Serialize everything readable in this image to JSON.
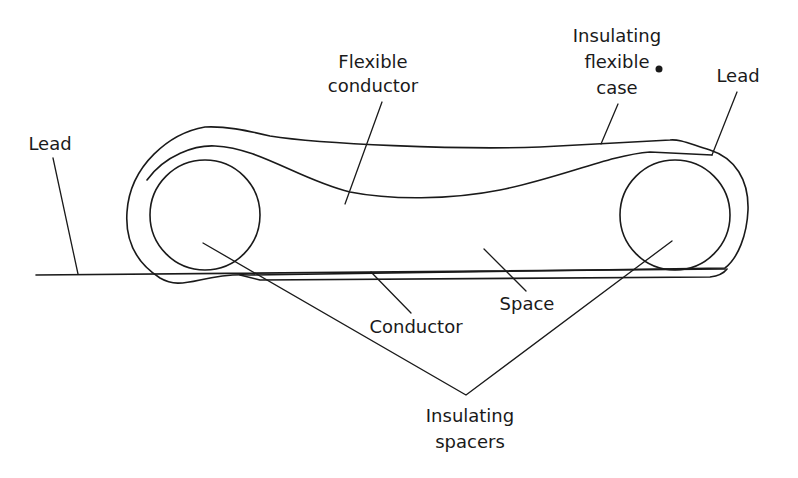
{
  "diagram": {
    "labels": {
      "flexible_conductor": [
        "Flexible",
        "conductor"
      ],
      "insulating_flexible_case": [
        "Insulating",
        "flexible",
        "case"
      ],
      "lead_left": "Lead",
      "lead_right": "Lead",
      "space": "Space",
      "conductor": "Conductor",
      "insulating_spacers": [
        "Insulating",
        "spacers"
      ]
    },
    "colors": {
      "line": "#1a1a1a",
      "background": "#ffffff"
    }
  }
}
